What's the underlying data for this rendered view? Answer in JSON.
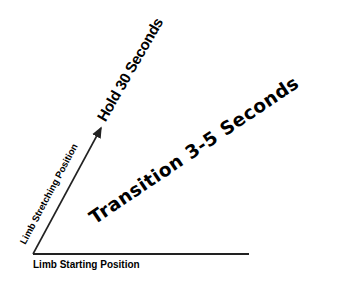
{
  "diagram": {
    "baseline_label": "Limb Starting Position",
    "diagonal_label": "Limb Stretching Position",
    "hold_label": "Hold 30 Seconds",
    "transition_label": "Transition 3-5 Seconds",
    "line_color": "#222222"
  }
}
